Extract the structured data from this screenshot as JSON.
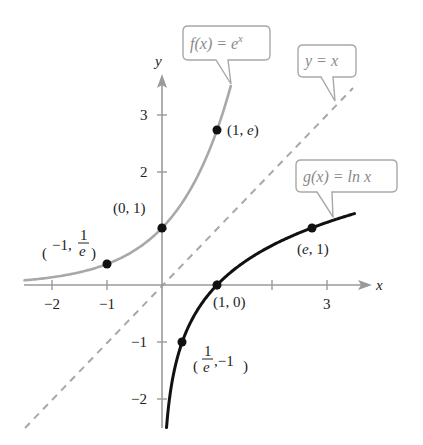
{
  "chart_data": {
    "type": "line",
    "title": "",
    "xlabel": "x",
    "ylabel": "y",
    "xlim": [
      -2.5,
      3.7
    ],
    "ylim": [
      -2.5,
      3.7
    ],
    "grid": false,
    "x_ticks": [
      -2,
      -1,
      1,
      2,
      3
    ],
    "x_tick_labels": [
      "−2",
      "−1",
      "",
      "",
      "3"
    ],
    "y_ticks": [
      -2,
      -1,
      1,
      2,
      3
    ],
    "y_tick_labels": [
      "−2",
      "−1",
      "",
      "2",
      "3"
    ],
    "series": [
      {
        "name": "f(x) = e^x",
        "label": "f(x) = e",
        "label_sup": "x",
        "color": "#a8a8a8",
        "style": "solid",
        "x_range": [
          -2.5,
          1.25
        ],
        "points": [
          {
            "x": -1,
            "y": 0.368,
            "label": "(−1, 1/e)"
          },
          {
            "x": 0,
            "y": 1,
            "label": "(0, 1)"
          },
          {
            "x": 1,
            "y": 2.718,
            "label": "(1, e)"
          }
        ]
      },
      {
        "name": "g(x) = ln x",
        "label": "g(x) = ln x",
        "color": "#111111",
        "style": "solid",
        "x_range": [
          0.082,
          3.5
        ],
        "points": [
          {
            "x": 0.368,
            "y": -1,
            "label": "(1/e, −1)"
          },
          {
            "x": 1,
            "y": 0,
            "label": "(1, 0)"
          },
          {
            "x": 2.718,
            "y": 1,
            "label": "(e, 1)"
          }
        ]
      },
      {
        "name": "y = x",
        "label": "y = x",
        "color": "#a8a8a8",
        "style": "dashed",
        "x_range": [
          -2.5,
          3.4
        ]
      }
    ]
  },
  "labels": {
    "x_axis": "x",
    "y_axis": "y",
    "tick_x_neg2": "−2",
    "tick_x_neg1": "−1",
    "tick_x_3": "3",
    "tick_y_3": "3",
    "tick_y_2": "2",
    "tick_y_neg1": "−1",
    "tick_y_neg2": "−2",
    "pt_f_neg1_a": "−1,",
    "pt_f_neg1_num": "1",
    "pt_f_neg1_den": "e",
    "pt_f_0": "(0, 1)",
    "pt_f_1_a": "(1, ",
    "pt_f_1_e": "e",
    "pt_f_1_b": ")",
    "pt_g_e_a": "(",
    "pt_g_e_e": "e",
    "pt_g_e_b": ", 1)",
    "pt_g_1": "(1, 0)",
    "pt_g_inv_num": "1",
    "pt_g_inv_den": "e",
    "pt_g_inv_b": ",−1",
    "callout_f": "f(x) = e",
    "callout_f_sup": "x",
    "callout_g": "g(x) = ln x",
    "callout_yx": "y = x"
  }
}
